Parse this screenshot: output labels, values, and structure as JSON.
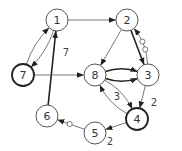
{
  "diagram": {
    "type": "directed-graph",
    "nodes": [
      {
        "id": "1",
        "label": "1",
        "bold": false
      },
      {
        "id": "2",
        "label": "2",
        "bold": false
      },
      {
        "id": "3",
        "label": "3",
        "bold": false
      },
      {
        "id": "4",
        "label": "4",
        "bold": true
      },
      {
        "id": "5",
        "label": "5",
        "bold": false
      },
      {
        "id": "6",
        "label": "6",
        "bold": false
      },
      {
        "id": "7",
        "label": "7",
        "bold": true
      },
      {
        "id": "8",
        "label": "8",
        "bold": false
      }
    ],
    "edges": [
      {
        "from": "1",
        "to": "2",
        "label": "",
        "thick": false,
        "dotted_markers": 0
      },
      {
        "from": "1",
        "to": "7",
        "label": "",
        "thick": false,
        "dotted_markers": 0
      },
      {
        "from": "7",
        "to": "1",
        "label": "",
        "thick": false,
        "dotted_markers": 0
      },
      {
        "from": "6",
        "to": "1",
        "label": "7",
        "thick": true,
        "dotted_markers": 0
      },
      {
        "from": "7",
        "to": "8",
        "label": "",
        "thick": false,
        "dotted_markers": 0
      },
      {
        "from": "2",
        "to": "8",
        "label": "",
        "thick": false,
        "dotted_markers": 0
      },
      {
        "from": "2",
        "to": "3",
        "label": "",
        "thick": true,
        "dotted_markers": 0
      },
      {
        "from": "3",
        "to": "2",
        "label": "",
        "thick": false,
        "dotted_markers": 2
      },
      {
        "from": "8",
        "to": "3",
        "label": "",
        "thick": true,
        "dotted_markers": 0
      },
      {
        "from": "8",
        "to": "3",
        "label": "",
        "thick": true,
        "dotted_markers": 0
      },
      {
        "from": "3",
        "to": "4",
        "label": "2",
        "thick": false,
        "dotted_markers": 0
      },
      {
        "from": "4",
        "to": "8",
        "label": "3",
        "thick": false,
        "dotted_markers": 0
      },
      {
        "from": "8",
        "to": "4",
        "label": "",
        "thick": false,
        "dotted_markers": 0
      },
      {
        "from": "4",
        "to": "5",
        "label": "2",
        "thick": false,
        "dotted_markers": 0
      },
      {
        "from": "5",
        "to": "6",
        "label": "",
        "thick": false,
        "dotted_markers": 1
      }
    ]
  }
}
